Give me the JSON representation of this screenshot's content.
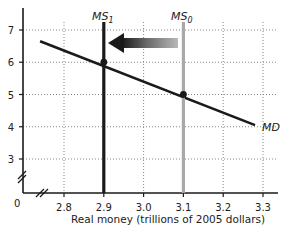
{
  "chart_data": {
    "type": "line",
    "title": "",
    "xlabel": "Real money (trillions of 2005 dollars)",
    "ylabel": "",
    "xlim": [
      2.7,
      3.35
    ],
    "ylim": [
      2,
      7.5
    ],
    "origin_label": "0",
    "axis_breaks": true,
    "grid": true,
    "grid_style": "dotted",
    "x_ticks": [
      2.8,
      2.9,
      3.0,
      3.1,
      3.2,
      3.3
    ],
    "x_tick_labels": [
      "2.8",
      "2.9",
      "3.0",
      "3.1",
      "3.2",
      "3.3"
    ],
    "y_ticks": [
      3,
      4,
      5,
      6,
      7
    ],
    "y_tick_labels": [
      "3",
      "4",
      "5",
      "6",
      "7"
    ],
    "series": [
      {
        "name": "MD",
        "label": "MD",
        "kind": "demand-curve",
        "color": "#1a1a1a",
        "x": [
          2.74,
          3.28
        ],
        "y": [
          6.65,
          4.05
        ]
      },
      {
        "name": "MS0",
        "label_main": "MS",
        "label_sub": "0",
        "kind": "vertical-supply",
        "color": "#a8a8a8",
        "x": [
          3.1,
          3.1
        ],
        "y": [
          2,
          7.3
        ]
      },
      {
        "name": "MS1",
        "label_main": "MS",
        "label_sub": "1",
        "kind": "vertical-supply",
        "color": "#1a1a1a",
        "x": [
          2.9,
          2.9
        ],
        "y": [
          2,
          7.3
        ]
      }
    ],
    "points": [
      {
        "name": "equilibrium-0",
        "x": 3.1,
        "y": 5
      },
      {
        "name": "equilibrium-1",
        "x": 2.9,
        "y": 6
      }
    ],
    "annotations": [
      {
        "type": "arrow",
        "direction": "left",
        "from_x": 3.08,
        "to_x": 2.91,
        "y": 6.45,
        "meaning": "money supply decreases from MS0 to MS1"
      }
    ]
  }
}
